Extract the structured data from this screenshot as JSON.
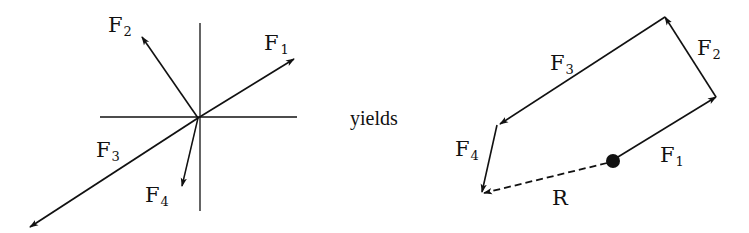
{
  "figure": {
    "left_diagram": {
      "description": "Concurrent force system at a point",
      "axes": {
        "vertical": true,
        "horizontal": true
      },
      "forces": [
        {
          "name": "F",
          "sub": "1"
        },
        {
          "name": "F",
          "sub": "2"
        },
        {
          "name": "F",
          "sub": "3"
        },
        {
          "name": "F",
          "sub": "4"
        }
      ]
    },
    "connector_text": "yields",
    "right_diagram": {
      "description": "Force polygon (head-to-tail) with resultant",
      "forces": [
        {
          "name": "F",
          "sub": "1"
        },
        {
          "name": "F",
          "sub": "2"
        },
        {
          "name": "F",
          "sub": "3"
        },
        {
          "name": "F",
          "sub": "4"
        }
      ],
      "resultant": {
        "name": "R",
        "style": "dashed"
      }
    }
  }
}
